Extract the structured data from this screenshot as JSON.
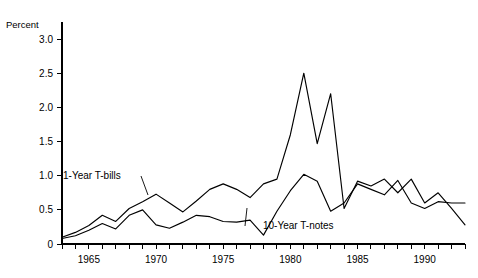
{
  "chart_data": {
    "type": "line",
    "title": "",
    "xlabel": "",
    "ylabel": "Percent",
    "ylim": [
      0,
      3.25
    ],
    "xlim": [
      1963,
      1993
    ],
    "grid": false,
    "legend_position": "inline-annotations",
    "ytick_labels": [
      "0",
      "0.5",
      "1.0",
      "1.5",
      "2.0",
      "2.5",
      "3.0"
    ],
    "ytick_values": [
      0,
      0.5,
      1.0,
      1.5,
      2.0,
      2.5,
      3.0
    ],
    "xtick_labels": [
      "1965",
      "1970",
      "1975",
      "1980",
      "1985",
      "1990"
    ],
    "xtick_label_values": [
      1965,
      1970,
      1975,
      1980,
      1985,
      1990
    ],
    "xtick_values": [
      1963,
      1964,
      1965,
      1966,
      1967,
      1968,
      1969,
      1970,
      1971,
      1972,
      1973,
      1974,
      1975,
      1976,
      1977,
      1978,
      1979,
      1980,
      1981,
      1982,
      1983,
      1984,
      1985,
      1986,
      1987,
      1988,
      1989,
      1990,
      1991,
      1992,
      1993
    ],
    "x": [
      1963,
      1964,
      1965,
      1966,
      1967,
      1968,
      1969,
      1970,
      1971,
      1972,
      1973,
      1974,
      1975,
      1976,
      1977,
      1978,
      1979,
      1980,
      1981,
      1982,
      1983,
      1984,
      1985,
      1986,
      1987,
      1988,
      1989,
      1990,
      1991,
      1992,
      1993
    ],
    "series": [
      {
        "name": "1-Year T-bills",
        "label": "1-Year T-bills",
        "values": [
          0.1,
          0.17,
          0.27,
          0.42,
          0.33,
          0.52,
          0.62,
          0.73,
          0.6,
          0.47,
          0.63,
          0.8,
          0.88,
          0.8,
          0.68,
          0.88,
          0.95,
          1.6,
          2.5,
          1.47,
          2.2,
          0.52,
          0.92,
          0.85,
          0.95,
          0.75,
          0.95,
          0.6,
          0.75,
          0.52,
          0.28
        ]
      },
      {
        "name": "10-Year T-notes",
        "label": "10-Year T-notes",
        "values": [
          0.08,
          0.12,
          0.2,
          0.3,
          0.22,
          0.42,
          0.5,
          0.28,
          0.23,
          0.32,
          0.42,
          0.4,
          0.33,
          0.32,
          0.35,
          0.13,
          0.48,
          0.78,
          1.02,
          0.92,
          0.48,
          0.6,
          0.88,
          0.8,
          0.72,
          0.93,
          0.6,
          0.52,
          0.62,
          0.6,
          0.6
        ]
      }
    ],
    "annotations": [
      {
        "text": "1-Year T-bills",
        "x_px": 63,
        "y_px": 179,
        "leader_to_x_px": 148,
        "leader_to_y_px": 195
      },
      {
        "text": "10-Year T-notes",
        "x_px": 263,
        "y_px": 229,
        "leader_to_x_px": 247,
        "leader_to_y_px": 208
      }
    ]
  }
}
